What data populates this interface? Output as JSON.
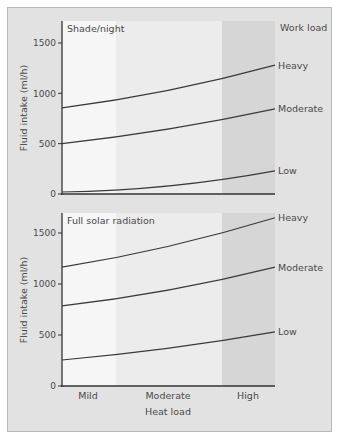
{
  "chart_data": [
    {
      "type": "line",
      "title": "Shade/night",
      "xlabel": "",
      "ylabel": "Fluid intake (ml/h)",
      "ylim": [
        0,
        1700
      ],
      "yticks": [
        0,
        500,
        1000,
        1500
      ],
      "x": [
        "Mild",
        "Moderate",
        "High"
      ],
      "x_positions": [
        0,
        0.5,
        1
      ],
      "legend_title": "Work load",
      "legend_placement": "right",
      "series": [
        {
          "name": "Heavy",
          "values": [
            855,
            1030,
            1280
          ]
        },
        {
          "name": "Moderate",
          "values": [
            500,
            645,
            845
          ]
        },
        {
          "name": "Low",
          "values": [
            20,
            80,
            230
          ]
        }
      ]
    },
    {
      "type": "line",
      "title": "Full solar radiation",
      "xlabel": "Heat load",
      "ylabel": "Fluid intake (ml/h)",
      "ylim": [
        0,
        1700
      ],
      "yticks": [
        0,
        500,
        1000,
        1500
      ],
      "x": [
        "Mild",
        "Moderate",
        "High"
      ],
      "x_positions": [
        0,
        0.5,
        1
      ],
      "legend_placement": "right",
      "series": [
        {
          "name": "Heavy",
          "values": [
            1165,
            1370,
            1650
          ]
        },
        {
          "name": "Moderate",
          "values": [
            785,
            940,
            1165
          ]
        },
        {
          "name": "Low",
          "values": [
            255,
            370,
            530
          ]
        }
      ]
    }
  ],
  "labels": {
    "work_load": "Work load",
    "heat_load": "Heat load",
    "ylabel_top": "Fluid intake (ml/h)",
    "ylabel_bottom": "Fluid intake (ml/h)",
    "panel_top_title": "Shade/night",
    "panel_bottom_title": "Full solar radiation",
    "x_categories": [
      "Mild",
      "Moderate",
      "High"
    ]
  },
  "colors": {
    "band_mild": "#f6f6f6",
    "band_moderate": "#ececec",
    "band_high": "#d6d6d6",
    "line": "#3a3a3a",
    "axis": "#333333"
  }
}
